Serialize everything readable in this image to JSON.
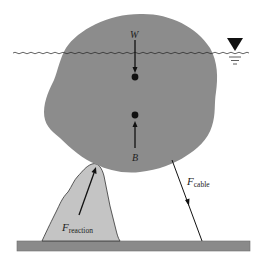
{
  "figure": {
    "colors": {
      "body_fill": "#8c8c8c",
      "rock_fill": "#c4c4c4",
      "ground_fill": "#8a8a8a",
      "line": "#111111",
      "background": "#ffffff"
    },
    "labels": {
      "weight": "W",
      "buoyancy": "B",
      "reaction_main": "F",
      "reaction_sub": "reaction",
      "cable_main": "F",
      "cable_sub": "cable"
    },
    "symbols": {
      "free_surface": "inverted-triangle-water-level-icon"
    }
  }
}
